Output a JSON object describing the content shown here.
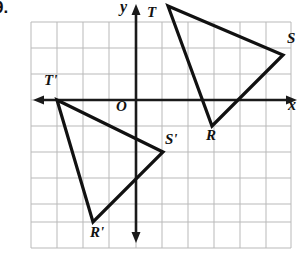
{
  "problem": {
    "number": "9."
  },
  "figure": {
    "colors": {
      "grid": "#b9b9b9",
      "axis": "#1a1a1a",
      "shape": "#111111",
      "background": "#ffffff"
    },
    "grid": {
      "spacing_px": 26,
      "x_start_px": 31,
      "x_end_px": 291,
      "y_start_px": 22,
      "y_end_px": 248,
      "visible": true
    },
    "axes": {
      "origin_px": {
        "x": 136,
        "y": 100
      },
      "x_axis": {
        "label": "x",
        "label_x_px": 291,
        "label_y_px": 106,
        "arrow_left_px": 33,
        "arrow_right_px": 297
      },
      "y_axis": {
        "label": "y",
        "label_x_px": 122,
        "label_y_px": 4,
        "arrow_top_px": 4,
        "arrow_bottom_px": 243
      }
    },
    "preimage": {
      "name": "triangle RST",
      "vertices": [
        {
          "label": "T",
          "px": {
            "x": 168,
            "y": 6
          },
          "label_px": {
            "x": 151,
            "y": 8
          }
        },
        {
          "label": "S",
          "px": {
            "x": 283,
            "y": 55
          },
          "label_px": {
            "x": 289,
            "y": 36
          }
        },
        {
          "label": "R",
          "px": {
            "x": 212,
            "y": 126
          },
          "label_px": {
            "x": 210,
            "y": 129
          }
        }
      ]
    },
    "image": {
      "name": "triangle R'S'T'",
      "vertices": [
        {
          "label": "T'",
          "px": {
            "x": 57,
            "y": 100
          },
          "label_px": {
            "x": 48,
            "y": 77
          }
        },
        {
          "label": "S'",
          "px": {
            "x": 163,
            "y": 152
          },
          "label_px": {
            "x": 167,
            "y": 133
          }
        },
        {
          "label": "R'",
          "px": {
            "x": 93,
            "y": 222
          },
          "label_px": {
            "x": 94,
            "y": 224
          }
        }
      ]
    }
  }
}
